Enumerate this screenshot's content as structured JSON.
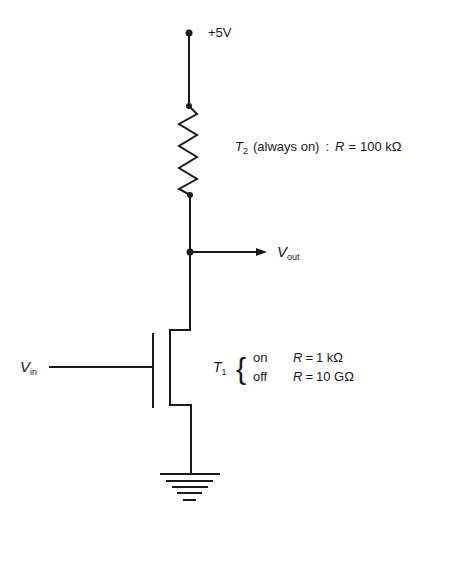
{
  "diagram": {
    "type": "nmos-inverter-schematic",
    "supply": {
      "label": "+5V"
    },
    "load_transistor": {
      "name": "T",
      "subscript": "2",
      "description": "(always on)",
      "separator": ":",
      "r_symbol": "R",
      "equals": "=",
      "value": "100 kΩ"
    },
    "output": {
      "symbol": "V",
      "subscript": "out"
    },
    "input": {
      "symbol": "V",
      "subscript": "in"
    },
    "switch_transistor": {
      "name": "T",
      "subscript": "1",
      "brace": "{",
      "states": [
        {
          "state": "on",
          "r_symbol": "R",
          "equals": "=",
          "value": "1 kΩ"
        },
        {
          "state": "off",
          "r_symbol": "R",
          "equals": "=",
          "value": "10 GΩ"
        }
      ]
    },
    "ground": {
      "symbol": "ground"
    },
    "colors": {
      "ink": "#1a1a1a",
      "background": "#ffffff"
    }
  }
}
